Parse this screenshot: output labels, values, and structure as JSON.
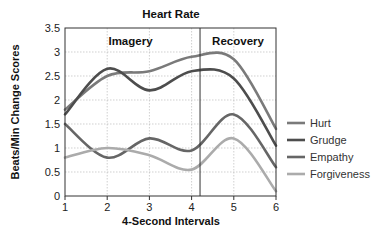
{
  "chart_data": {
    "type": "line",
    "title": "Heart Rate",
    "xlabel": "4-Second Intervals",
    "ylabel": "Beats/Min Change Scores",
    "x": [
      1,
      2,
      3,
      4,
      5,
      6
    ],
    "x_ticks": [
      "1",
      "2",
      "3",
      "4",
      "5",
      "6"
    ],
    "xlim": [
      1,
      6
    ],
    "y_ticks": [
      "0",
      "0.5",
      "1",
      "1.5",
      "2",
      "2.5",
      "3",
      "3.5"
    ],
    "ylim": [
      0,
      3.5
    ],
    "grid": true,
    "phase_divider_x": 4.2,
    "annotations": [
      {
        "text": "Imagery",
        "region": "left"
      },
      {
        "text": "Recovery",
        "region": "right"
      }
    ],
    "legend_position": "right",
    "series": [
      {
        "name": "Hurt",
        "color": "#7a7a7a",
        "values": [
          1.8,
          2.5,
          2.6,
          2.9,
          2.85,
          1.4
        ]
      },
      {
        "name": "Grudge",
        "color": "#4d4d4d",
        "values": [
          1.7,
          2.65,
          2.2,
          2.6,
          2.45,
          1.05
        ]
      },
      {
        "name": "Empathy",
        "color": "#666666",
        "values": [
          1.5,
          0.8,
          1.2,
          0.95,
          1.7,
          0.6
        ]
      },
      {
        "name": "Forgiveness",
        "color": "#ababab",
        "values": [
          0.8,
          1.0,
          0.85,
          0.55,
          1.2,
          0.1
        ]
      }
    ]
  }
}
